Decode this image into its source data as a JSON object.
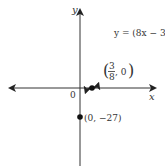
{
  "chart_data": {
    "type": "line",
    "title": "",
    "xlabel": "x",
    "ylabel": "y",
    "origin_label": "0",
    "grid": false,
    "function": "y = (8x - 3)^3",
    "curve_label": "y = (8x − 3)",
    "curve_label_exponent": "3",
    "points": [
      {
        "x": 0.375,
        "y": 0,
        "label_num": "3",
        "label_den": "8",
        "label_rest": ", 0",
        "name": "x-intercept"
      },
      {
        "x": 0,
        "y": -27,
        "label": "(0, −27)",
        "name": "y-intercept"
      }
    ],
    "colors": {
      "axis": "#222222",
      "curve": "#333333",
      "point": "#111111"
    }
  }
}
